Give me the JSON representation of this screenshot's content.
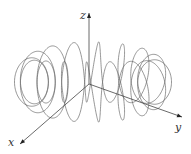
{
  "figure": {
    "axes": {
      "origin": [
        89,
        84
      ],
      "x": {
        "label": "x",
        "end": [
          20,
          144
        ],
        "label_pos": [
          8,
          146
        ]
      },
      "y": {
        "label": "y",
        "end": [
          182,
          117
        ],
        "label_pos": [
          175,
          131
        ]
      },
      "z": {
        "label": "z",
        "end": [
          89,
          13
        ],
        "label_pos": [
          80,
          19
        ]
      }
    },
    "helix": {
      "windings": 16,
      "center": [
        93,
        82
      ],
      "major_rx": 62,
      "major_ry": 10,
      "minor_r": 30,
      "minor_ry": 30,
      "samples": 1600,
      "color": "#6a6a6a"
    },
    "colors": {
      "background": "#ffffff",
      "curve": "#6a6a6a",
      "axis": "#444444"
    }
  }
}
